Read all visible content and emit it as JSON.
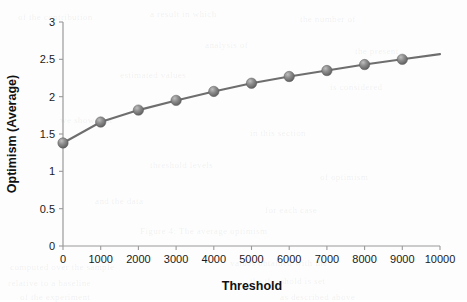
{
  "chart_data": {
    "type": "line",
    "title": "",
    "xlabel": "Threshold",
    "ylabel": "Optimism (Average)",
    "x": [
      0,
      1000,
      2000,
      3000,
      4000,
      5000,
      6000,
      7000,
      8000,
      9000
    ],
    "values": [
      1.38,
      1.66,
      1.82,
      1.95,
      2.07,
      2.18,
      2.27,
      2.35,
      2.43,
      2.5
    ],
    "series": [
      {
        "name": "Optimism (Average)",
        "values": [
          1.38,
          1.66,
          1.82,
          1.95,
          2.07,
          2.18,
          2.27,
          2.35,
          2.43,
          2.5
        ]
      }
    ],
    "xlim": [
      0,
      10000
    ],
    "ylim": [
      0,
      3
    ],
    "xticks": [
      0,
      1000,
      2000,
      3000,
      4000,
      5000,
      6000,
      7000,
      8000,
      9000,
      10000
    ],
    "yticks": [
      0,
      0.5,
      1,
      1.5,
      2,
      2.5,
      3
    ],
    "xtick_labels": [
      "0",
      "1000",
      "2000",
      "3000",
      "4000",
      "5000",
      "6000",
      "7000",
      "8000",
      "9000",
      "10000"
    ],
    "ytick_labels": [
      "0",
      "0.5",
      "1",
      "1.5",
      "2",
      "2.5",
      "3"
    ],
    "grid": false,
    "legend": null,
    "line_color": "#6e6e6e",
    "marker_color": "#787878",
    "marker_shape": "sphere",
    "axis_color": "#9a9a9a",
    "background_color": "#fdfdfd",
    "line_extends_past_last_point_to_x": 10000,
    "annotations": []
  },
  "background_artifacts": [
    {
      "text": "of the contribution",
      "x": 18,
      "y": 12
    },
    {
      "text": "a result in which",
      "x": 150,
      "y": 9
    },
    {
      "text": "the number of",
      "x": 300,
      "y": 14
    },
    {
      "text": "analysis of",
      "x": 205,
      "y": 40
    },
    {
      "text": "the present",
      "x": 355,
      "y": 46
    },
    {
      "text": "estimated values",
      "x": 120,
      "y": 70
    },
    {
      "text": "is considered",
      "x": 330,
      "y": 82
    },
    {
      "text": "we show that",
      "x": 60,
      "y": 115
    },
    {
      "text": "in this section",
      "x": 250,
      "y": 128
    },
    {
      "text": "threshold levels",
      "x": 150,
      "y": 160
    },
    {
      "text": "of optimism",
      "x": 320,
      "y": 172
    },
    {
      "text": "and the data",
      "x": 95,
      "y": 196
    },
    {
      "text": "for each case",
      "x": 265,
      "y": 205
    },
    {
      "text": "Figure 4: The average optimism",
      "x": 140,
      "y": 226
    },
    {
      "text": "computed over the sample",
      "x": 10,
      "y": 262
    },
    {
      "text": "values obtained with the",
      "x": 230,
      "y": 258
    },
    {
      "text": "relative to a baseline",
      "x": 8,
      "y": 278
    },
    {
      "text": "the threshold is set",
      "x": 250,
      "y": 276
    },
    {
      "text": "of the experiment",
      "x": 20,
      "y": 292
    },
    {
      "text": "as described above",
      "x": 280,
      "y": 292
    }
  ]
}
